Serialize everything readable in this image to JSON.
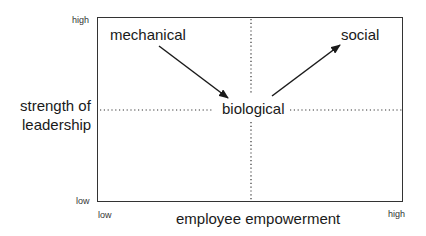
{
  "diagram": {
    "x_axis": {
      "label": "employee empowerment",
      "low": "low",
      "high": "high"
    },
    "y_axis": {
      "label_line1": "strength of",
      "label_line2": "leadership",
      "low": "low",
      "high": "high"
    },
    "nodes": [
      {
        "id": "mechanical",
        "label": "mechanical"
      },
      {
        "id": "biological",
        "label": "biological"
      },
      {
        "id": "social",
        "label": "social"
      }
    ],
    "edges": [
      {
        "from": "mechanical",
        "to": "biological"
      },
      {
        "from": "biological",
        "to": "social"
      }
    ],
    "colors": {
      "line": "#333333",
      "text": "#1a1a1a"
    }
  }
}
